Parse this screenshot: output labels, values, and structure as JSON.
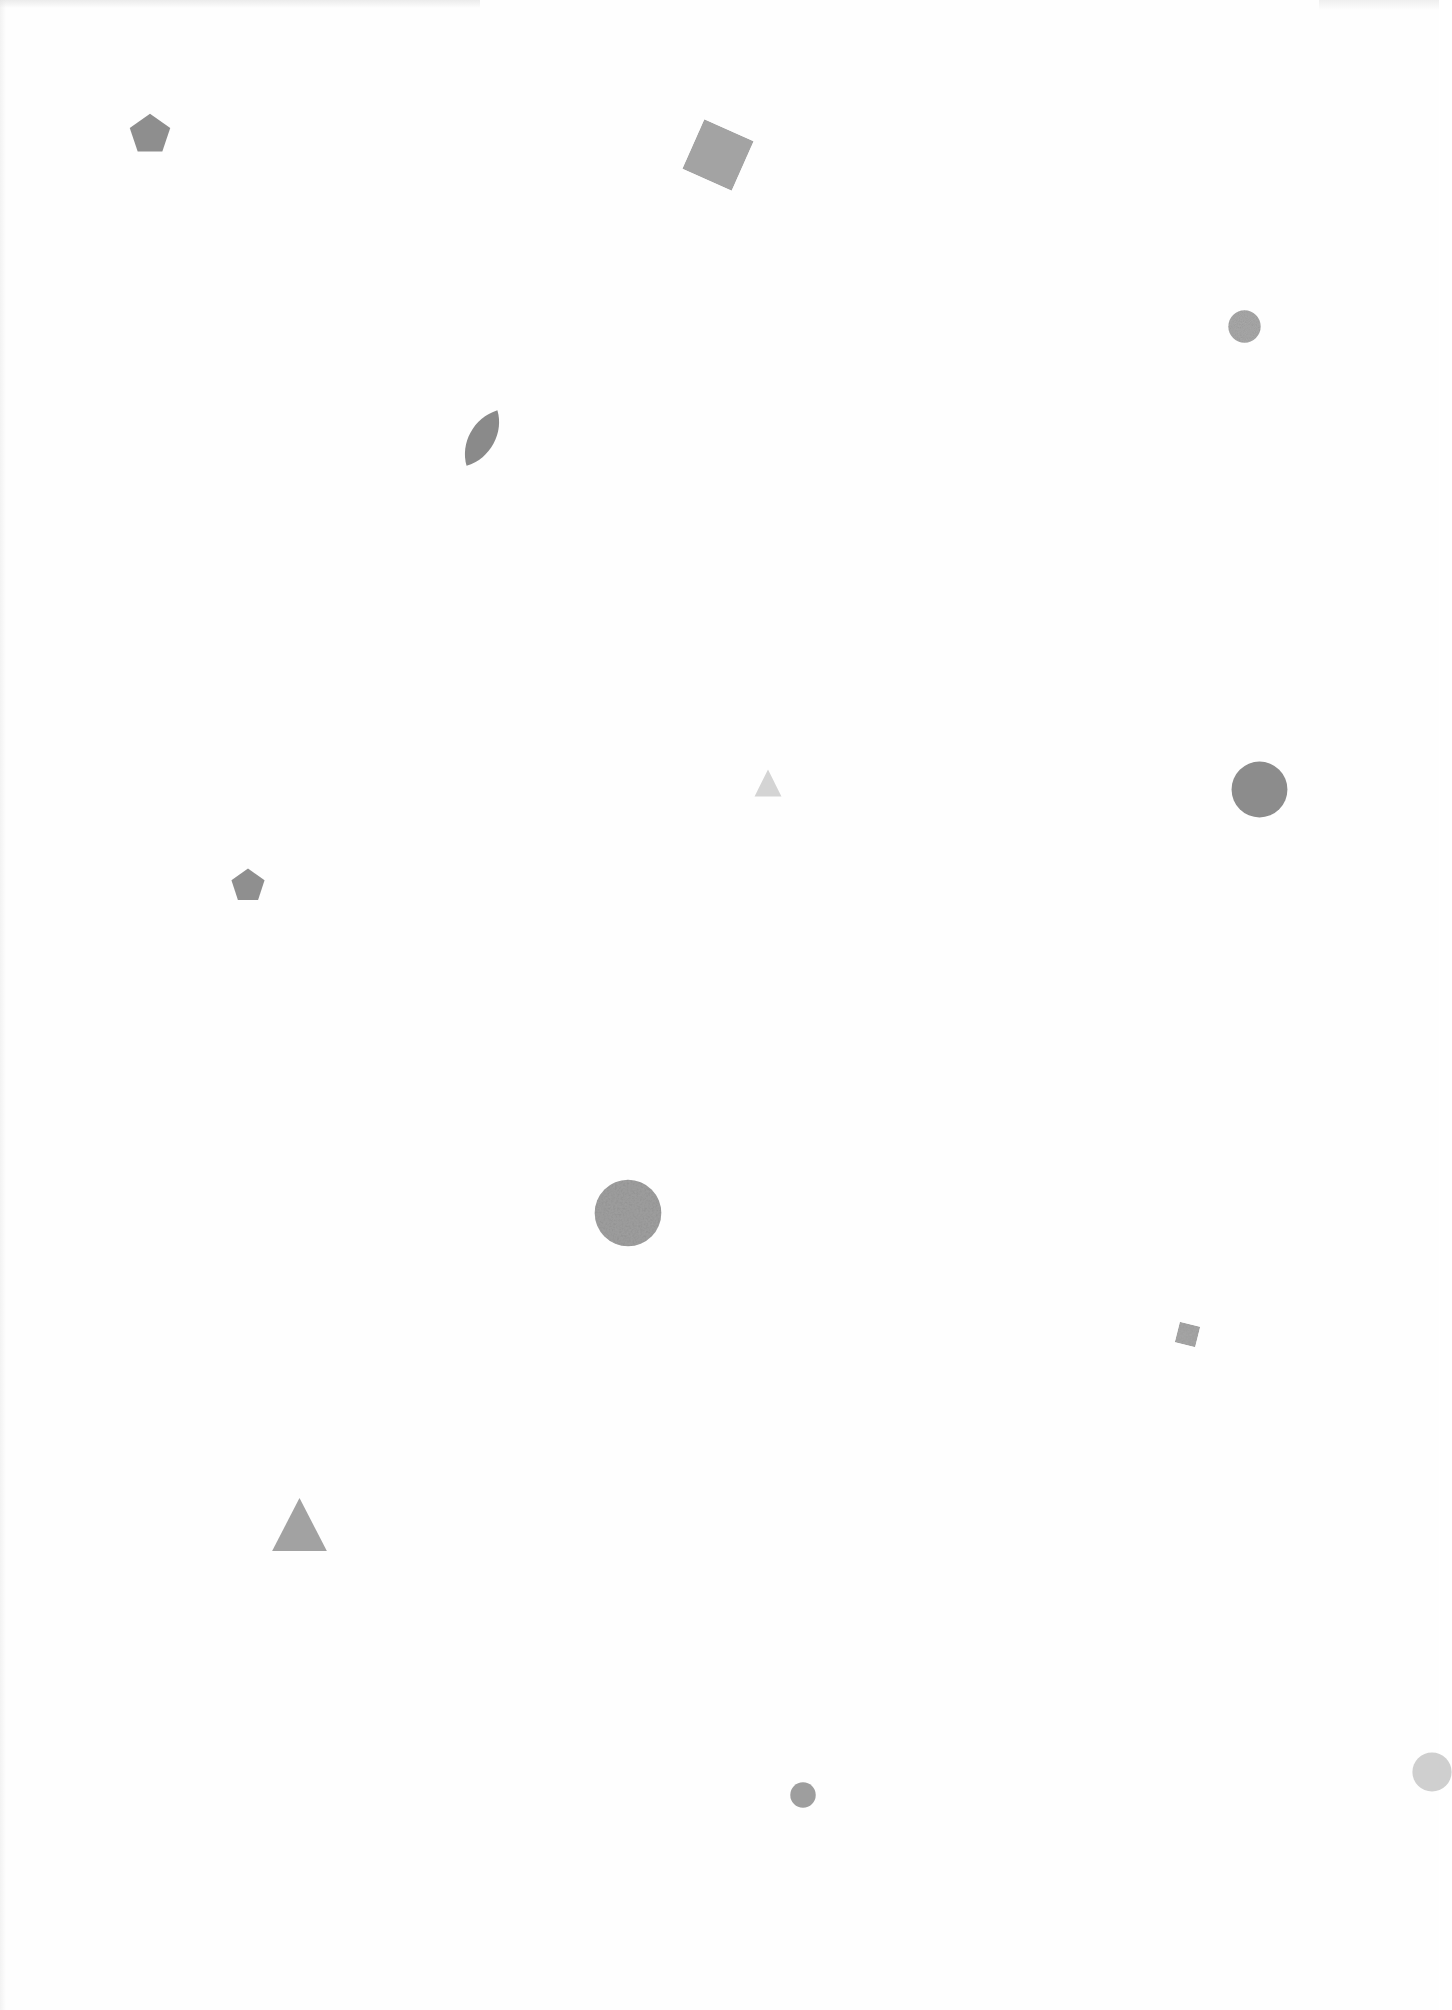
{
  "page": {
    "background": "#fefefe"
  },
  "shapes": [
    {
      "id": "pentagon-1",
      "type": "pentagon",
      "x": 150,
      "y": 133,
      "w": 44,
      "h": 42,
      "rotation": 0,
      "color": "#8e8e8e"
    },
    {
      "id": "square-1",
      "type": "square",
      "x": 718,
      "y": 155,
      "w": 54,
      "h": 54,
      "rotation": 24,
      "color": "#a3a3a3"
    },
    {
      "id": "circle-textured-1",
      "type": "circle",
      "x": 1244,
      "y": 326,
      "w": 33,
      "h": 33,
      "rotation": 0,
      "color": "#a9a9a9",
      "textured": true
    },
    {
      "id": "leaf-1",
      "type": "leaf",
      "x": 482,
      "y": 438,
      "w": 44,
      "h": 58,
      "rotation": 0,
      "color": "#8a8a8a"
    },
    {
      "id": "triangle-small-1",
      "type": "triangle",
      "x": 768,
      "y": 783,
      "w": 28,
      "h": 28,
      "rotation": 0,
      "color": "#d4d4d4"
    },
    {
      "id": "circle-1",
      "type": "circle",
      "x": 1259,
      "y": 789,
      "w": 57,
      "h": 57,
      "rotation": 0,
      "color": "#8c8c8c"
    },
    {
      "id": "pentagon-2",
      "type": "pentagon",
      "x": 248,
      "y": 884,
      "w": 36,
      "h": 35,
      "rotation": 0,
      "color": "#8f8f8f"
    },
    {
      "id": "circle-textured-2",
      "type": "circle",
      "x": 628,
      "y": 1213,
      "w": 68,
      "h": 68,
      "rotation": 0,
      "color": "#a0a0a0",
      "textured": true
    },
    {
      "id": "square-small-1",
      "type": "square",
      "x": 1187,
      "y": 1334,
      "w": 21,
      "h": 21,
      "rotation": 14,
      "color": "#a8a8a8",
      "textured": true
    },
    {
      "id": "triangle-1",
      "type": "triangle",
      "x": 299,
      "y": 1524,
      "w": 57,
      "h": 55,
      "rotation": 0,
      "color": "#a2a2a2"
    },
    {
      "id": "circle-small-1",
      "type": "circle",
      "x": 803,
      "y": 1795,
      "w": 26,
      "h": 26,
      "rotation": 0,
      "color": "#9e9e9e"
    },
    {
      "id": "circle-partial-1",
      "type": "circle",
      "x": 1432,
      "y": 1772,
      "w": 40,
      "h": 40,
      "rotation": 0,
      "color": "#cfcfcf"
    }
  ]
}
